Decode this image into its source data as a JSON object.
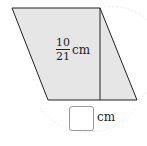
{
  "figure": {
    "shape": "parallelogram",
    "fill_color": "#e6e6e6",
    "stroke_color": "#222222",
    "height_label": {
      "numerator": "10",
      "denominator": "21",
      "unit": "cm"
    },
    "answer_box": {
      "value": "",
      "unit": "cm"
    }
  }
}
